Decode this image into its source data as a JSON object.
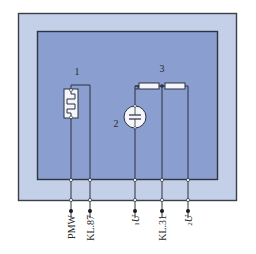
{
  "colors": {
    "outer_frame": "#c3d0e8",
    "inner_panel": "#8a9fcf",
    "border": "#3a3f4a",
    "wire": "#2b3040",
    "component_fill": "#f4f6fb"
  },
  "components": [
    {
      "id": "1",
      "label": "1",
      "type": "heating-element"
    },
    {
      "id": "2",
      "label": "2",
      "type": "sensor-capacitive"
    },
    {
      "id": "3",
      "label": "3",
      "type": "resistor-divider"
    }
  ],
  "pins": [
    {
      "label": "PMW",
      "sub": ""
    },
    {
      "label": "KL.87",
      "sub": ""
    },
    {
      "label": "U",
      "sub": "1"
    },
    {
      "label": "KL.31",
      "sub": ""
    },
    {
      "label": "U",
      "sub": "2"
    }
  ]
}
